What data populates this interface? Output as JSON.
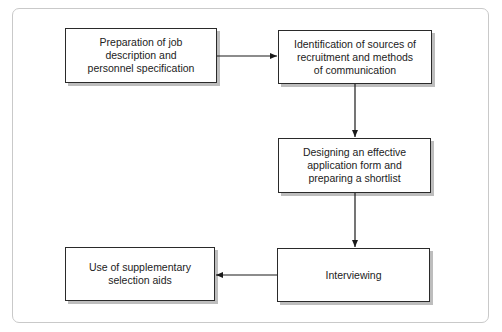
{
  "diagram": {
    "type": "flowchart",
    "nodes": [
      {
        "id": "n1",
        "lines": [
          "Preparation of job",
          "description and",
          "personnel specification"
        ]
      },
      {
        "id": "n2",
        "lines": [
          "Identification of sources of",
          "recruitment and methods",
          "of communication"
        ]
      },
      {
        "id": "n3",
        "lines": [
          "Designing an effective",
          "application form and",
          "preparing a shortlist"
        ]
      },
      {
        "id": "n4",
        "lines": [
          "Interviewing"
        ]
      },
      {
        "id": "n5",
        "lines": [
          "Use of supplementary",
          "selection aids"
        ]
      }
    ],
    "edges": [
      {
        "from": "n1",
        "to": "n2",
        "direction": "right"
      },
      {
        "from": "n2",
        "to": "n3",
        "direction": "down"
      },
      {
        "from": "n3",
        "to": "n4",
        "direction": "down"
      },
      {
        "from": "n4",
        "to": "n5",
        "direction": "left"
      }
    ],
    "colors": {
      "border": "#2a2a2a",
      "shadow": "#bdbdbd",
      "frame": "#c9c9c9"
    }
  }
}
